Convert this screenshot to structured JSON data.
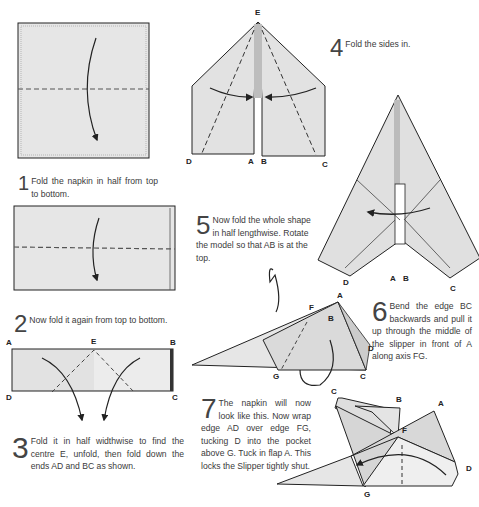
{
  "steps": [
    {
      "number": "1",
      "text": "Fold the napkin in half from top to bottom."
    },
    {
      "number": "2",
      "text": "Now fold it again from top to bottom."
    },
    {
      "number": "3",
      "text": "Fold it in half widthwise to find the centre E, unfold, then fold down the ends AD and BC as shown."
    },
    {
      "number": "4",
      "text": "Fold the sides in."
    },
    {
      "number": "5",
      "text": "Now fold the whole shape in half lengthwise. Rotate the model so that AB is at the top."
    },
    {
      "number": "6",
      "text": "Bend the edge BC backwards and pull it up through the middle of the slipper in front of A along axis FG."
    },
    {
      "number": "7",
      "text": "The napkin will now look like this. Now wrap edge AD over edge FG, tucking D into the pocket above G. Tuck in flap A. This locks the Slipper tightly shut."
    }
  ],
  "labels": {
    "s3": {
      "A": "A",
      "B": "B",
      "C": "C",
      "D": "D",
      "E": "E"
    },
    "s4": {
      "A": "A",
      "B": "B",
      "C": "C",
      "D": "D",
      "E": "E"
    },
    "s5": {
      "A": "A",
      "B": "B",
      "C": "C",
      "D": "D"
    },
    "s6": {
      "A": "A",
      "B": "B",
      "C": "C",
      "D": "D",
      "F": "F",
      "G": "G"
    },
    "s7": {
      "A": "A",
      "B": "B",
      "C": "C",
      "D": "D",
      "F": "F",
      "G": "G"
    }
  },
  "colors": {
    "paper": "#e4e4e4",
    "paper_dark": "#cfcfcf",
    "line": "#222222",
    "text": "#3a3a3a"
  }
}
